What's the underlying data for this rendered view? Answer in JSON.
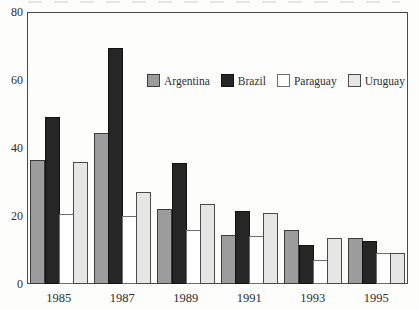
{
  "chart_data": {
    "type": "bar",
    "title": "",
    "xlabel": "",
    "ylabel": "",
    "categories": [
      "1985",
      "1987",
      "1989",
      "1991",
      "1993",
      "1995"
    ],
    "series": [
      {
        "name": "Argentina",
        "color": "#9c9c9c",
        "border": "#3c3c3c",
        "values": [
          36.5,
          44.5,
          22,
          14.5,
          16,
          13.5
        ]
      },
      {
        "name": "Brazil",
        "color": "#262626",
        "border": "#111111",
        "values": [
          49,
          69.5,
          35.5,
          21.5,
          11.5,
          12.5
        ]
      },
      {
        "name": "Paraguay",
        "color": "#ffffff",
        "border": "#6e6e6e",
        "values": [
          20.5,
          20,
          16,
          14,
          7,
          9
        ]
      },
      {
        "name": "Uruguay",
        "color": "#e6e6e6",
        "border": "#4a4a4a",
        "values": [
          36,
          27,
          23.5,
          21,
          13.5,
          9
        ]
      }
    ],
    "ylim": [
      0,
      80
    ],
    "yticks": [
      0,
      20,
      40,
      60,
      80
    ],
    "grid": false,
    "legend_position": "inside-top",
    "frame": true,
    "axis_color": "#4a4a4a",
    "text_color": "#2e2e2e"
  }
}
